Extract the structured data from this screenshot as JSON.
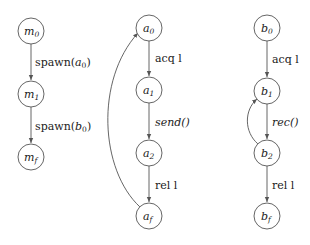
{
  "diagram": {
    "type": "state-machine",
    "colors": {
      "stroke": "#555555",
      "text": "#222222",
      "background": "#ffffff"
    },
    "machines": [
      {
        "id": "m",
        "nodes": [
          {
            "id": "m0",
            "base": "m",
            "sub": "0",
            "x": 31,
            "y": 31
          },
          {
            "id": "m1",
            "base": "m",
            "sub": "1",
            "x": 31,
            "y": 94
          },
          {
            "id": "mf",
            "base": "m",
            "sub": "f",
            "x": 31,
            "y": 157
          }
        ],
        "edges": [
          {
            "from": "m0",
            "to": "m1",
            "label": "spawn(a₀)",
            "label_text": "spawn(",
            "label_arg_base": "a",
            "label_arg_sub": "0",
            "label_end": ")"
          },
          {
            "from": "m1",
            "to": "mf",
            "label": "spawn(b₀)",
            "label_text": "spawn(",
            "label_arg_base": "b",
            "label_arg_sub": "0",
            "label_end": ")"
          }
        ]
      },
      {
        "id": "a",
        "nodes": [
          {
            "id": "a0",
            "base": "a",
            "sub": "0",
            "x": 149,
            "y": 28
          },
          {
            "id": "a1",
            "base": "a",
            "sub": "1",
            "x": 149,
            "y": 90
          },
          {
            "id": "a2",
            "base": "a",
            "sub": "2",
            "x": 149,
            "y": 153
          },
          {
            "id": "af",
            "base": "a",
            "sub": "f",
            "x": 149,
            "y": 216
          }
        ],
        "edges": [
          {
            "from": "a0",
            "to": "a1",
            "label": "acq l"
          },
          {
            "from": "a1",
            "to": "a2",
            "label": "send()",
            "italic": true
          },
          {
            "from": "a2",
            "to": "af",
            "label": "rel l"
          },
          {
            "from": "af",
            "to": "a0",
            "label": "",
            "curved": true
          }
        ]
      },
      {
        "id": "b",
        "nodes": [
          {
            "id": "b0",
            "base": "b",
            "sub": "0",
            "x": 267,
            "y": 28
          },
          {
            "id": "b1",
            "base": "b",
            "sub": "1",
            "x": 267,
            "y": 91
          },
          {
            "id": "b2",
            "base": "b",
            "sub": "2",
            "x": 267,
            "y": 153
          },
          {
            "id": "bf",
            "base": "b",
            "sub": "f",
            "x": 267,
            "y": 216
          }
        ],
        "edges": [
          {
            "from": "b0",
            "to": "b1",
            "label": "acq l"
          },
          {
            "from": "b1",
            "to": "b2",
            "label": "rec()",
            "italic": true
          },
          {
            "from": "b2",
            "to": "bf",
            "label": "rel l"
          },
          {
            "from": "b2",
            "to": "b1",
            "label": "",
            "curved": true
          }
        ]
      }
    ]
  }
}
